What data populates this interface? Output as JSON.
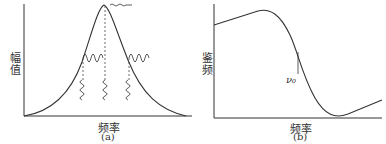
{
  "panel_a": {
    "ylabel": "幅值",
    "xlabel": "频率",
    "caption": "(a)"
  },
  "panel_b": {
    "ylabel": "鉴频",
    "xlabel": "频率",
    "caption": "(b)",
    "annotation": "ν₀"
  }
}
